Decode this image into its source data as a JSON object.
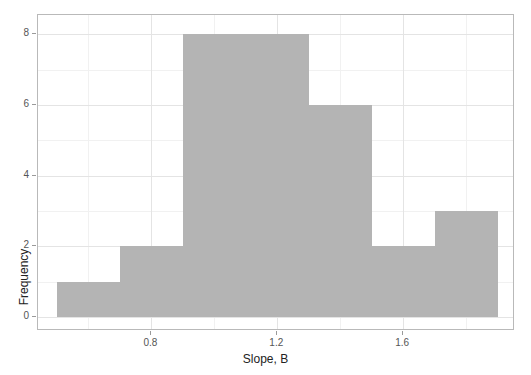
{
  "chart_data": {
    "type": "bar",
    "title": "",
    "subtitle": "",
    "xlabel": "Slope, B",
    "ylabel": "Frequency",
    "bin_edges": [
      0.5,
      0.7,
      0.9,
      1.1,
      1.3,
      1.5,
      1.7,
      1.9
    ],
    "bin_width": 0.2,
    "categories": [
      "0.5-0.7",
      "0.7-0.9",
      "0.9-1.1",
      "1.1-1.3",
      "1.3-1.5",
      "1.5-1.7",
      "1.7-1.9"
    ],
    "values": [
      1,
      2,
      8,
      8,
      6,
      2,
      3
    ],
    "bars": [
      {
        "left": 0.5,
        "right": 0.7,
        "count": 1
      },
      {
        "left": 0.7,
        "right": 0.9,
        "count": 2
      },
      {
        "left": 0.9,
        "right": 1.1,
        "count": 8
      },
      {
        "left": 1.1,
        "right": 1.3,
        "count": 8
      },
      {
        "left": 1.3,
        "right": 1.5,
        "count": 6
      },
      {
        "left": 1.5,
        "right": 1.7,
        "count": 2
      },
      {
        "left": 1.7,
        "right": 1.9,
        "count": 3
      }
    ],
    "xlim": [
      0.44,
      1.955
    ],
    "ylim": [
      -0.4,
      8.55
    ],
    "xticks": [
      0.8,
      1.2,
      1.6
    ],
    "xtick_labels": [
      "0.8",
      "1.2",
      "1.6"
    ],
    "xticks_minor": [
      0.6,
      1.0,
      1.4,
      1.8
    ],
    "yticks": [
      0,
      2,
      4,
      6,
      8
    ],
    "ytick_labels": [
      "0",
      "2",
      "4",
      "6",
      "8"
    ],
    "yticks_minor": [
      1,
      3,
      5,
      7
    ],
    "grid": true,
    "legend": false,
    "legend_position": "none",
    "bar_color": "#b4b4b4",
    "grid_color": "#ebebeb",
    "panel_border_color": "#b9b9b9",
    "background_color": "#ffffff",
    "text_color": "#555555"
  }
}
